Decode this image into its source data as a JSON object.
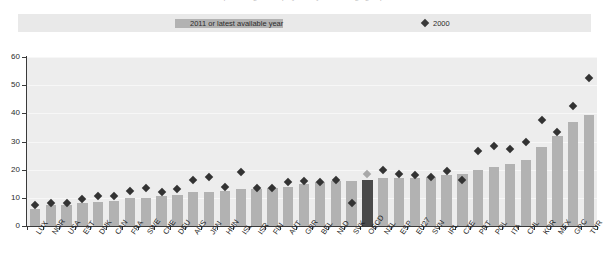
{
  "title": {
    "text": "percentage of employees, by sex and age group"
  },
  "legend": {
    "items": [
      {
        "label": "2011 or latest available year",
        "marker": "bar-swatch",
        "color": "#b2b2b2"
      },
      {
        "label": "2000",
        "marker": "diamond",
        "color": "#3a3a3a"
      }
    ]
  },
  "axes": {
    "y_ticks": [
      "0",
      "10",
      "20",
      "30",
      "40",
      "50",
      "60"
    ],
    "y_min": 0,
    "y_max": 60
  },
  "chart_data": {
    "type": "bar",
    "title": "percentage of employees, by sex and age group",
    "xlabel": "",
    "ylabel": "",
    "ylim": [
      0,
      60
    ],
    "ytick_step": 10,
    "grid": true,
    "legend_position": "top",
    "highlight_category": "OECD",
    "categories": [
      "LUX",
      "NOR",
      "USA",
      "EST",
      "DNK",
      "CAN",
      "FRA",
      "SWE",
      "CHE",
      "DEU",
      "AUS",
      "JPN",
      "HUN",
      "ISL",
      "ISR",
      "FIN",
      "AUT",
      "GBR",
      "BEL",
      "NLD",
      "SVK",
      "OECD",
      "NZL",
      "ESP",
      "EU27",
      "SVN",
      "IRL",
      "CZE",
      "PRT",
      "POL",
      "ITA",
      "CHL",
      "KOR",
      "MEX",
      "GRC",
      "TUR"
    ],
    "series": [
      {
        "name": "2011 or latest available year",
        "type": "bar",
        "color": "#b2b2b2",
        "values": [
          6.0,
          7.5,
          7.5,
          8.0,
          8.5,
          9.0,
          10.0,
          10.0,
          10.5,
          11.0,
          12.0,
          12.0,
          12.5,
          13.0,
          13.0,
          13.5,
          14.0,
          15.0,
          15.5,
          16.0,
          16.0,
          16.5,
          17.0,
          17.0,
          17.0,
          17.5,
          18.0,
          18.5,
          20.0,
          21.0,
          22.0,
          23.5,
          28.0,
          32.0,
          37.0,
          39.5
        ]
      },
      {
        "name": "2000",
        "type": "scatter",
        "color": "#333333",
        "values": [
          7.5,
          8.0,
          8.0,
          9.5,
          10.5,
          10.5,
          12.5,
          13.5,
          12.0,
          13.0,
          16.5,
          17.5,
          14.0,
          19.0,
          13.5,
          13.5,
          15.5,
          16.0,
          15.5,
          16.5,
          8.0,
          18.5,
          20.0,
          18.5,
          18.0,
          17.5,
          19.5,
          16.5,
          26.5,
          28.5,
          27.5,
          30.0,
          37.5,
          33.5,
          42.5,
          52.5
        ]
      }
    ]
  }
}
